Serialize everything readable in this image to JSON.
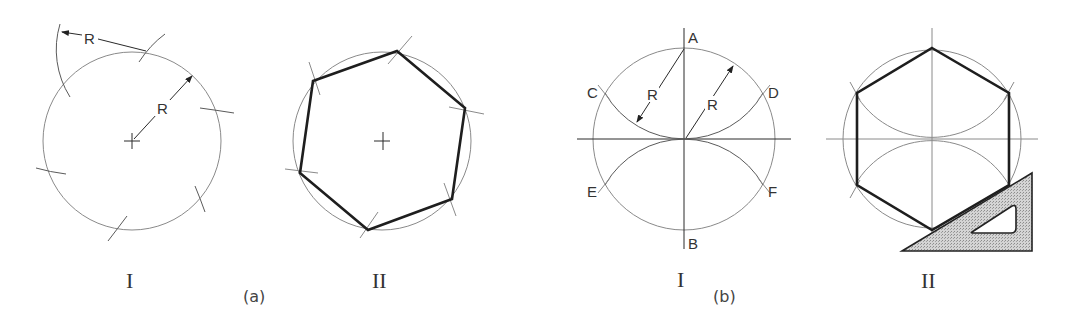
{
  "figure": {
    "panel_a": {
      "caption": "(a)",
      "step_1": {
        "label": "I",
        "radius_label": "R",
        "arc_radius_label": "R",
        "description": "Circle with radius R; arcs of radius R stepped off around circumference"
      },
      "step_2": {
        "label": "II",
        "description": "Hexagon joined through the six arc intersection points"
      }
    },
    "panel_b": {
      "caption": "(b)",
      "step_1": {
        "label": "I",
        "points": [
          "A",
          "B",
          "C",
          "D",
          "E",
          "F"
        ],
        "radius_labels": [
          "R",
          "R"
        ],
        "description": "Arcs of radius R centered at A and B intersect circle at C, D, E, F"
      },
      "step_2": {
        "label": "II",
        "description": "Hexagon drawn using 30-60 triangle",
        "tool": "30-60 set square triangle"
      }
    },
    "colors": {
      "construction_line": "#8a8a8a",
      "object_line": "#1e1e1e",
      "triangle_fill": "#c8c8c8"
    }
  }
}
